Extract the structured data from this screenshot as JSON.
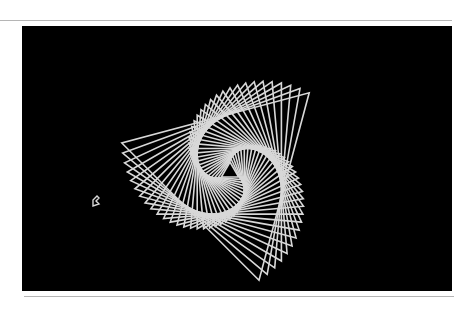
{
  "screen": {
    "background": "#000000",
    "pen_color": "#d8d8d8",
    "width": 430,
    "height": 265
  },
  "drawing": {
    "shape": "triangle",
    "center": [
      208,
      146
    ],
    "count": 34,
    "start_radius": 10,
    "end_radius": 112,
    "start_angle_deg": -90,
    "angle_step_deg": 5,
    "stroke_width": 1.6
  },
  "turtle": {
    "icon": "turtle-cursor-icon",
    "x": 93,
    "y": 206,
    "heading_deg": 0
  }
}
